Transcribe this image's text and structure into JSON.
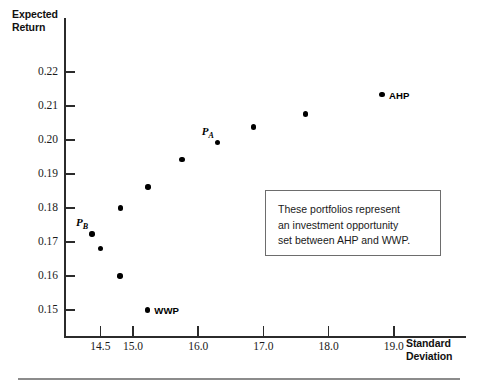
{
  "chart_data": {
    "type": "scatter",
    "title": "",
    "xlabel": "Standard Deviation",
    "ylabel": "Expected Return",
    "xlim": [
      14.2,
      19.5
    ],
    "ylim": [
      0.145,
      0.225
    ],
    "grid": false,
    "legend": "none",
    "x_ticks": [
      "14.5",
      "15.0",
      "16.0",
      "17.0",
      "18.0",
      "19.0"
    ],
    "x_tick_values": [
      14.5,
      15.0,
      16.0,
      17.0,
      18.0,
      19.0
    ],
    "y_ticks": [
      "0.22",
      "0.21",
      "0.20",
      "0.19",
      "0.18",
      "0.17",
      "0.16",
      "0.15"
    ],
    "y_tick_values": [
      0.22,
      0.21,
      0.2,
      0.19,
      0.18,
      0.17,
      0.16,
      0.15
    ],
    "points": [
      {
        "label": "P_B",
        "label_text": "P",
        "label_sub": "B",
        "label_style": "italic",
        "x": 14.37,
        "y": 0.1724
      },
      {
        "label": "",
        "label_text": "",
        "label_sub": "",
        "label_style": "none",
        "x": 14.5,
        "y": 0.168
      },
      {
        "label": "",
        "label_text": "",
        "label_sub": "",
        "label_style": "none",
        "x": 14.8,
        "y": 0.16
      },
      {
        "label": "",
        "label_text": "",
        "label_sub": "",
        "label_style": "none",
        "x": 14.81,
        "y": 0.18
      },
      {
        "label": "WWP",
        "label_text": "WWP",
        "label_sub": "",
        "label_style": "bold",
        "x": 15.22,
        "y": 0.15
      },
      {
        "label": "",
        "label_text": "",
        "label_sub": "",
        "label_style": "none",
        "x": 15.23,
        "y": 0.1862
      },
      {
        "label": "",
        "label_text": "",
        "label_sub": "",
        "label_style": "none",
        "x": 15.75,
        "y": 0.1942
      },
      {
        "label": "P_A",
        "label_text": "P",
        "label_sub": "A",
        "label_style": "italic",
        "x": 16.3,
        "y": 0.1992
      },
      {
        "label": "",
        "label_text": "",
        "label_sub": "",
        "label_style": "none",
        "x": 16.85,
        "y": 0.2038
      },
      {
        "label": "",
        "label_text": "",
        "label_sub": "",
        "label_style": "none",
        "x": 17.65,
        "y": 0.2077
      },
      {
        "label": "AHP",
        "label_text": "AHP",
        "label_sub": "",
        "label_style": "bold",
        "x": 18.82,
        "y": 0.2133
      }
    ],
    "annotation": {
      "text": "These portfolios represent\nan investment opportunity\nset between AHP and WWP."
    }
  },
  "axes": {
    "y_title": "Expected\nReturn",
    "x_title": "Standard\nDeviation"
  },
  "colors": {
    "point": "#000000",
    "axis": "#2b2b2b",
    "text": "#1a1a1a",
    "box_border": "#6d6d6d",
    "footer_rule": "#8c8c8c",
    "background": "#ffffff"
  }
}
